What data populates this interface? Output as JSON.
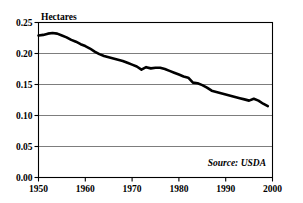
{
  "chart_data": {
    "type": "line",
    "title": "",
    "subtitle": "",
    "ylabel": "Hectares",
    "xlabel": "",
    "source_note": "Source: USDA",
    "grid": true,
    "legend": "none",
    "xlim": [
      1950,
      2000
    ],
    "ylim": [
      0.0,
      0.25
    ],
    "y_ticks": [
      "0.00",
      "0.05",
      "0.10",
      "0.15",
      "0.20",
      "0.25"
    ],
    "y_tick_values": [
      0.0,
      0.05,
      0.1,
      0.15,
      0.2,
      0.25
    ],
    "x_ticks": [
      "1950",
      "1960",
      "1970",
      "1980",
      "1990",
      "2000"
    ],
    "x_tick_values": [
      1950,
      1960,
      1970,
      1980,
      1990,
      2000
    ],
    "series": [
      {
        "name": "Grain area per person",
        "color": "#000000",
        "x": [
          1950,
          1951,
          1952,
          1953,
          1954,
          1955,
          1956,
          1957,
          1958,
          1959,
          1960,
          1961,
          1962,
          1963,
          1964,
          1965,
          1966,
          1967,
          1968,
          1969,
          1970,
          1971,
          1972,
          1973,
          1974,
          1975,
          1976,
          1977,
          1978,
          1979,
          1980,
          1981,
          1982,
          1983,
          1984,
          1985,
          1986,
          1987,
          1988,
          1989,
          1990,
          1991,
          1992,
          1993,
          1994,
          1995,
          1996,
          1997,
          1998,
          1999
        ],
        "values": [
          0.229,
          0.23,
          0.232,
          0.233,
          0.232,
          0.229,
          0.226,
          0.222,
          0.219,
          0.215,
          0.212,
          0.208,
          0.203,
          0.199,
          0.196,
          0.194,
          0.192,
          0.19,
          0.188,
          0.185,
          0.182,
          0.179,
          0.174,
          0.178,
          0.176,
          0.177,
          0.177,
          0.175,
          0.172,
          0.169,
          0.166,
          0.163,
          0.161,
          0.153,
          0.152,
          0.149,
          0.145,
          0.14,
          0.138,
          0.136,
          0.134,
          0.132,
          0.13,
          0.128,
          0.126,
          0.124,
          0.127,
          0.124,
          0.119,
          0.115
        ]
      }
    ]
  },
  "figure": {
    "background_color": "#ffffff",
    "axis_color": "#000000",
    "grid_color": "#6e6e6e",
    "line_color": "#000000"
  }
}
